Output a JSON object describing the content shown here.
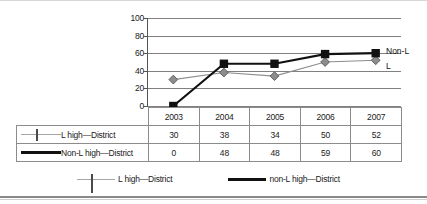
{
  "chart_data": {
    "type": "line",
    "title": "",
    "xlabel": "",
    "ylabel": "",
    "categories": [
      "2003",
      "2004",
      "2005",
      "2006",
      "2007"
    ],
    "yticks": [
      100,
      80,
      60,
      40,
      20,
      0
    ],
    "ylim": [
      0,
      100
    ],
    "grid": true,
    "legend_position": "bottom",
    "series": [
      {
        "name": "L high—District",
        "legend_name": "L high—District",
        "marker": "diamond",
        "color": "#8d8d8d",
        "values": [
          30,
          38,
          34,
          50,
          52
        ]
      },
      {
        "name": "Non-L high—District",
        "legend_name": "non-L high—District",
        "marker": "square",
        "color": "#111111",
        "values": [
          0,
          48,
          48,
          59,
          60
        ]
      }
    ],
    "annotations": [
      {
        "text": "Non-L",
        "series": "Non-L high—District"
      },
      {
        "text": "L",
        "series": "L high—District"
      }
    ]
  },
  "table": {
    "header_blank": "",
    "columns": [
      "2003",
      "2004",
      "2005",
      "2006",
      "2007"
    ],
    "rows": [
      {
        "label": "L high—District",
        "values": [
          "30",
          "38",
          "34",
          "50",
          "52"
        ]
      },
      {
        "label": "Non-L high—District",
        "values": [
          "0",
          "48",
          "48",
          "59",
          "60"
        ]
      }
    ]
  },
  "legend": {
    "items": [
      {
        "label": "L high—District"
      },
      {
        "label": "non-L high—District"
      }
    ]
  }
}
